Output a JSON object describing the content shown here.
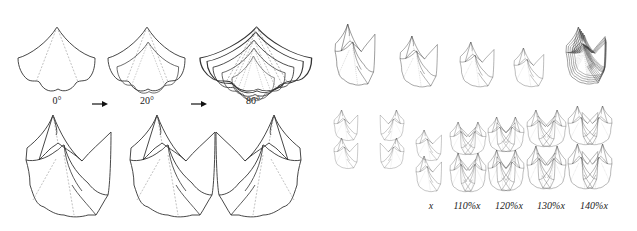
{
  "figure": {
    "top_left": {
      "angle_labels": [
        "0°",
        "20°",
        "80°"
      ],
      "arrows": [
        "arrow-right",
        "arrow-right"
      ]
    },
    "bottom_right": {
      "scale_labels": [
        "x",
        "110%x",
        "120%x",
        "130%x",
        "140%x"
      ]
    },
    "colors": {
      "line": "#333333",
      "dashed": "#888888",
      "background": "#ffffff"
    }
  }
}
